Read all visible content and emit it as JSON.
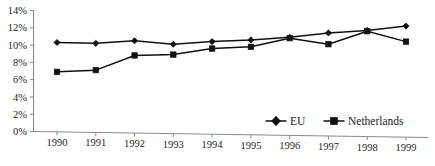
{
  "chart_data": {
    "type": "line",
    "title": "",
    "subtitle": "",
    "xlabel": "",
    "ylabel": "",
    "categories": [
      "1990",
      "1991",
      "1992",
      "1993",
      "1994",
      "1995",
      "1996",
      "1997",
      "1998",
      "1999"
    ],
    "x": [
      1990,
      1991,
      1992,
      1993,
      1994,
      1995,
      1996,
      1997,
      1998,
      1999
    ],
    "series": [
      {
        "name": "EU",
        "marker": "diamond",
        "color": "#111111",
        "values": [
          10.3,
          10.2,
          10.5,
          10.1,
          10.4,
          10.6,
          10.9,
          11.4,
          11.7,
          12.2
        ]
      },
      {
        "name": "Netherlands",
        "marker": "square",
        "color": "#111111",
        "values": [
          6.9,
          7.1,
          8.8,
          8.9,
          9.6,
          9.8,
          10.8,
          10.1,
          11.6,
          10.4
        ]
      }
    ],
    "ylim": [
      0,
      14
    ],
    "ytick_values": [
      0,
      2,
      4,
      6,
      8,
      10,
      12,
      14
    ],
    "ytick_labels": [
      "0%",
      "2%",
      "4%",
      "6%",
      "8%",
      "10%",
      "12%",
      "14%"
    ],
    "grid": false,
    "legend_position": "bottom-right",
    "legend_entries": [
      "EU",
      "Netherlands"
    ],
    "annotations": []
  },
  "legend": {
    "eu_label": "EU",
    "netherlands_label": "Netherlands"
  }
}
